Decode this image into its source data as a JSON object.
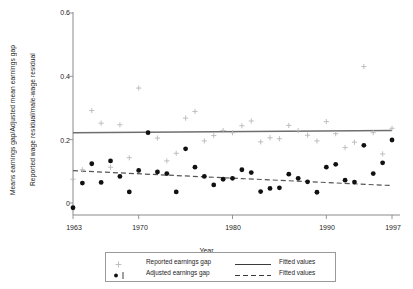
{
  "chart_data": {
    "type": "scatter",
    "title": "",
    "xlabel": "Year",
    "ylabel_outer": "Means earnings gap/Adjusted mean earnings gap",
    "ylabel_inner": "Reported wage residual/male-wage residual",
    "xlim": [
      1963,
      1997
    ],
    "ylim": [
      0,
      0.6
    ],
    "xticks": [
      1963,
      1970,
      1980,
      1990,
      1997
    ],
    "xticklabels": [
      "1963",
      "1970",
      "1980",
      "1990",
      "1997"
    ],
    "yticks": [
      0,
      0.2,
      0.4,
      0.6
    ],
    "yticklabels": [
      "0",
      "0.2",
      "0.4",
      "0.6"
    ],
    "grid": false,
    "legend_position": "below-axes",
    "series": [
      {
        "name": "Reported earnings gap",
        "marker": "plus",
        "color": "#b9b9b9",
        "x": [
          1963,
          1964,
          1965,
          1966,
          1967,
          1968,
          1969,
          1970,
          1971,
          1972,
          1973,
          1974,
          1975,
          1976,
          1977,
          1978,
          1979,
          1980,
          1981,
          1982,
          1983,
          1984,
          1985,
          1986,
          1987,
          1988,
          1989,
          1990,
          1991,
          1992,
          1993,
          1994,
          1995,
          1996,
          1997
        ],
        "y": [
          0.075,
          0.105,
          0.292,
          0.252,
          0.113,
          0.247,
          0.143,
          0.363,
          0.222,
          0.205,
          0.133,
          0.157,
          0.268,
          0.289,
          0.196,
          0.213,
          0.229,
          0.222,
          0.244,
          0.259,
          0.193,
          0.206,
          0.203,
          0.245,
          0.229,
          0.214,
          0.196,
          0.257,
          0.219,
          0.175,
          0.192,
          0.431,
          0.222,
          0.155,
          0.236
        ]
      },
      {
        "name": "Adjusted earnings gap",
        "marker": "dot",
        "color": "#111111",
        "x": [
          1963,
          1964,
          1965,
          1966,
          1967,
          1968,
          1969,
          1970,
          1971,
          1972,
          1973,
          1974,
          1975,
          1976,
          1977,
          1978,
          1979,
          1980,
          1981,
          1982,
          1983,
          1984,
          1985,
          1986,
          1987,
          1988,
          1989,
          1990,
          1991,
          1992,
          1993,
          1994,
          1995,
          1996,
          1997
        ],
        "y": [
          -0.015,
          0.063,
          0.124,
          0.065,
          0.133,
          0.084,
          0.035,
          0.103,
          0.222,
          0.098,
          0.093,
          0.035,
          0.171,
          0.113,
          0.084,
          0.057,
          0.075,
          0.078,
          0.105,
          0.096,
          0.036,
          0.046,
          0.048,
          0.091,
          0.078,
          0.067,
          0.034,
          0.113,
          0.122,
          0.072,
          0.066,
          0.182,
          0.093,
          0.127,
          0.199
        ]
      }
    ],
    "fits": [
      {
        "name": "Fitted values",
        "style": "solid",
        "color": "#6e6e6e",
        "for_series": "Reported earnings gap",
        "x": [
          1963,
          1997
        ],
        "y": [
          0.222,
          0.229
        ]
      },
      {
        "name": "Fitted values",
        "style": "dashed",
        "color": "#555555",
        "for_series": "Adjusted earnings gap",
        "x": [
          1963,
          1997
        ],
        "y": [
          0.102,
          0.055
        ]
      }
    ]
  },
  "legend": {
    "entries": [
      {
        "label": "Reported earnings gap",
        "marker": "plus-icon"
      },
      {
        "label": "Adjusted earnings gap",
        "marker": "dot-bar-icon"
      },
      {
        "label": "Fitted values",
        "marker": "solid-line-icon"
      },
      {
        "label": "Fitted values",
        "marker": "dashed-line-icon"
      }
    ]
  }
}
